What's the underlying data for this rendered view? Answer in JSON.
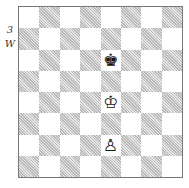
{
  "diagram": {
    "number": "3",
    "side_to_move": "W"
  },
  "board": {
    "orientation": "white",
    "top_left_square": "light",
    "pieces": [
      {
        "square": "e6",
        "piece": "black-king",
        "glyph": "♚"
      },
      {
        "square": "e4",
        "piece": "white-king",
        "glyph": "♔"
      },
      {
        "square": "e2",
        "piece": "white-pawn",
        "glyph": "♙"
      }
    ]
  }
}
